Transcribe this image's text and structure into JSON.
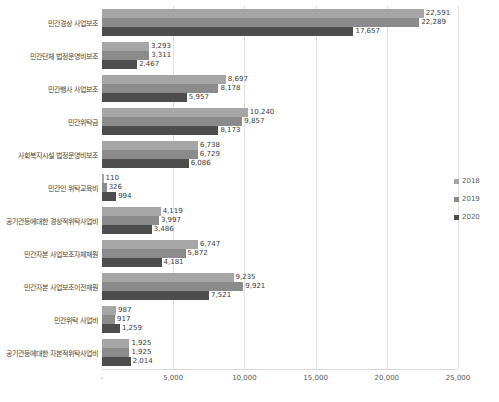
{
  "chart_data": {
    "type": "bar",
    "orientation": "horizontal",
    "title": "",
    "xlabel": "",
    "ylabel": "",
    "categories": [
      "민간경상 사업보조",
      "민간단체 법정운영비보조",
      "민간행사 사업보조",
      "민간위탁금",
      "사회복지시설 법정운영비보조",
      "민간인 위탁교육비",
      "공기관등에대한 경상적위탁사업비",
      "민간자본 사업보조자체재원",
      "민간자본 사업보조이전재원",
      "민간위탁 사업비",
      "공기관등에대한 자본적위탁사업비"
    ],
    "series": [
      {
        "name": "2018",
        "color": "#a6a6a6",
        "values": [
          22591,
          3293,
          8697,
          10240,
          6738,
          110,
          4119,
          6747,
          9235,
          987,
          1925
        ],
        "labels": [
          "22,591",
          "3,293",
          "8,697",
          "10,240",
          "6,738",
          "110",
          "4,119",
          "6,747",
          "9,235",
          "987",
          "1,925"
        ]
      },
      {
        "name": "2019",
        "color": "#8b8b8b",
        "values": [
          22289,
          3311,
          8178,
          9857,
          6729,
          326,
          3997,
          5872,
          9921,
          917,
          1925
        ],
        "labels": [
          "22,289",
          "3,311",
          "8,178",
          "9,857",
          "6,729",
          "326",
          "3,997",
          "5,872",
          "9,921",
          "917",
          "1,925"
        ]
      },
      {
        "name": "2020",
        "color": "#4d4d4d",
        "values": [
          17657,
          2467,
          5957,
          8173,
          6086,
          994,
          3486,
          4181,
          7521,
          1259,
          2014
        ],
        "labels": [
          "17,657",
          "2,467",
          "5,957",
          "8,173",
          "6,086",
          "994",
          "3,486",
          "4,181",
          "7,521",
          "1,259",
          "2,014"
        ]
      }
    ],
    "x_axis": {
      "min": 0,
      "max": 25000,
      "gridlines": true,
      "ticks": [
        {
          "value": 0,
          "label": "-"
        },
        {
          "value": 5000,
          "label": "5,000"
        },
        {
          "value": 10000,
          "label": "10,000"
        },
        {
          "value": 15000,
          "label": "15,000"
        },
        {
          "value": 20000,
          "label": "20,000"
        },
        {
          "value": 25000,
          "label": "25,000"
        }
      ]
    },
    "legend": {
      "position": "right",
      "items": [
        "2018",
        "2019",
        "2020"
      ]
    }
  }
}
